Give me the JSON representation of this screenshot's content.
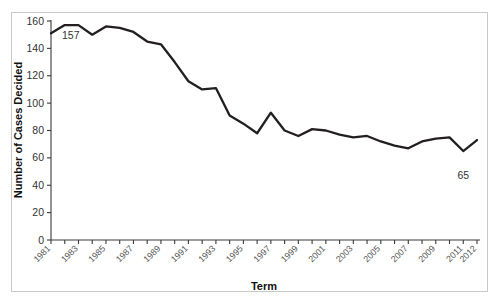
{
  "chart_data": {
    "type": "line",
    "title": "",
    "xlabel": "Term",
    "ylabel": "Number of Cases Decided",
    "ylim": [
      0,
      160
    ],
    "ytick_step": 20,
    "yticks": [
      0,
      20,
      40,
      60,
      80,
      100,
      120,
      140,
      160
    ],
    "grid": false,
    "legend": false,
    "line_color": "#231f20",
    "x": [
      1981,
      1982,
      1983,
      1984,
      1985,
      1986,
      1987,
      1988,
      1989,
      1990,
      1991,
      1992,
      1993,
      1994,
      1995,
      1996,
      1997,
      1998,
      1999,
      2000,
      2001,
      2002,
      2003,
      2004,
      2005,
      2006,
      2007,
      2008,
      2009,
      2010,
      2011,
      2012
    ],
    "categories": [
      "1981",
      "1982",
      "1983",
      "1984",
      "1985",
      "1986",
      "1987",
      "1988",
      "1989",
      "1990",
      "1991",
      "1992",
      "1993",
      "1994",
      "1995",
      "1996",
      "1997",
      "1998",
      "1999",
      "2000",
      "2001",
      "2002",
      "2003",
      "2004",
      "2005",
      "2006",
      "2007",
      "2008",
      "2009",
      "2010",
      "2011",
      "2012"
    ],
    "xtick_labels": [
      "1981",
      "1983",
      "1985",
      "1987",
      "1989",
      "1991",
      "1993",
      "1995",
      "1997",
      "1999",
      "2001",
      "2003",
      "2005",
      "2007",
      "2009",
      "2011",
      "2012"
    ],
    "values": [
      151,
      157,
      157,
      150,
      156,
      155,
      152,
      145,
      143,
      130,
      116,
      110,
      111,
      91,
      85,
      78,
      93,
      80,
      76,
      81,
      80,
      77,
      75,
      76,
      72,
      69,
      67,
      72,
      74,
      75,
      65,
      73
    ],
    "annotations": [
      {
        "label": "157",
        "x": 1982,
        "y": 157
      },
      {
        "label": "65",
        "x": 2011,
        "y": 65
      }
    ]
  },
  "axes": {
    "y_title": "Number of Cases Decided",
    "x_title": "Term"
  }
}
